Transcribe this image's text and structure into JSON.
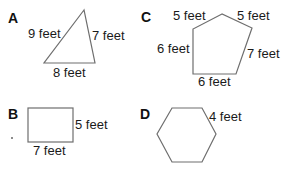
{
  "figures": [
    {
      "id": "A",
      "letter": "A",
      "shape": "triangle",
      "labels": [
        "9 feet",
        "7 feet",
        "8 feet"
      ]
    },
    {
      "id": "B",
      "letter": "B",
      "shape": "rectangle",
      "labels": [
        "5 feet",
        "7 feet"
      ]
    },
    {
      "id": "C",
      "letter": "C",
      "shape": "pentagon",
      "labels": [
        "5 feet",
        "5 feet",
        "6 feet",
        "7 feet",
        "6 feet"
      ]
    },
    {
      "id": "D",
      "letter": "D",
      "shape": "hexagon",
      "labels": [
        "4 feet"
      ]
    }
  ],
  "colors": {
    "stroke": "#6e6e6e",
    "text": "#1a1a1a"
  }
}
